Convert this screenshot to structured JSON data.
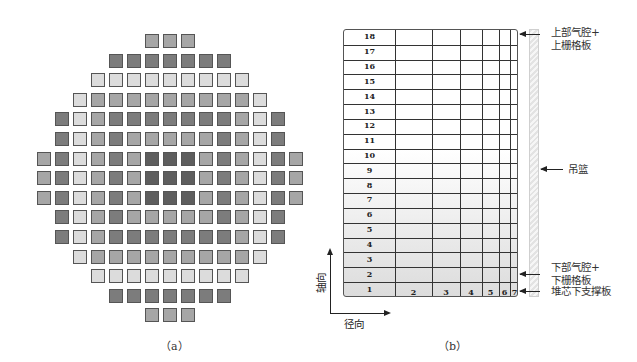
{
  "panel_a": {
    "caption": "（a）",
    "description": "Core loading map of fuel assemblies (15x15 lattice, 157 assemblies)",
    "shade_colors": {
      "L": "#dcdcdc",
      "M": "#a6a6a6",
      "D": "#7c7c7c",
      "X": "#5e5e5e"
    },
    "rows": [
      {
        "start": 6,
        "cells": "MMM"
      },
      {
        "start": 4,
        "cells": "DDDDDDD"
      },
      {
        "start": 3,
        "cells": "LLLLLLLLL"
      },
      {
        "start": 2,
        "cells": "LMMMMMMMMML"
      },
      {
        "start": 1,
        "cells": "DLMDDDDDDDMLD"
      },
      {
        "start": 1,
        "cells": "DLMDMMMMMDMLD"
      },
      {
        "start": 0,
        "cells": "MDLMDMXXXMDMLDM"
      },
      {
        "start": 0,
        "cells": "MDLMDMXXXMDMLDM"
      },
      {
        "start": 0,
        "cells": "MDLMDMXXXMDMLDM"
      },
      {
        "start": 1,
        "cells": "DLMDMMMMMDMLD"
      },
      {
        "start": 1,
        "cells": "DLMDDDDDDDMLD"
      },
      {
        "start": 2,
        "cells": "LMMMMMMMMML"
      },
      {
        "start": 3,
        "cells": "LLLLLLLLL"
      },
      {
        "start": 4,
        "cells": "DDDDDDD"
      },
      {
        "start": 6,
        "cells": "MMM"
      }
    ]
  },
  "panel_b": {
    "caption": "（b）",
    "axial_levels": [
      "18",
      "17",
      "16",
      "15",
      "14",
      "13",
      "12",
      "11",
      "10",
      "9",
      "8",
      "7",
      "6",
      "5",
      "4",
      "3",
      "2",
      "1"
    ],
    "radial_rings": [
      "2",
      "3",
      "4",
      "5",
      "6",
      "7"
    ],
    "axis_axial_label": "轴向",
    "axis_radial_label": "径向",
    "annotations": {
      "upper": [
        "上部气腔+",
        "上栅格板"
      ],
      "basket": "吊篮",
      "lower": [
        "下部气腔+",
        "下栅格板"
      ],
      "support": "堆芯下支撑板"
    }
  }
}
